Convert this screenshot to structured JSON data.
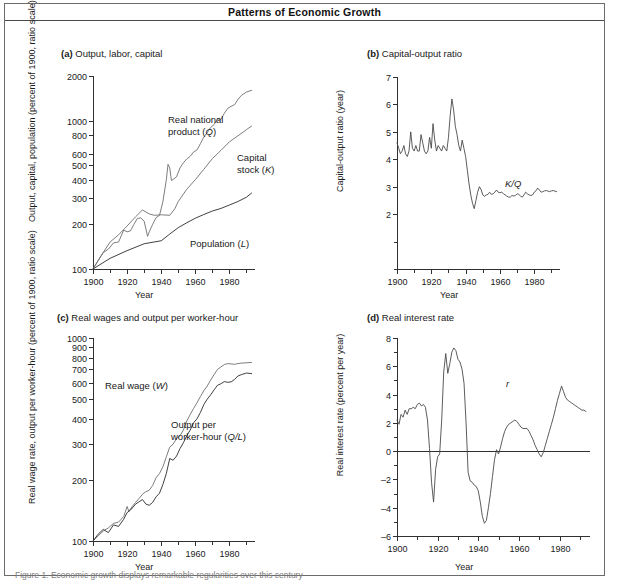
{
  "figure": {
    "title": "Patterns of Economic Growth",
    "caption": "Figure 1. Economic growth displays remarkable regularities over this century"
  },
  "common": {
    "xlabel": "Year",
    "xticks": [
      1900,
      1920,
      1940,
      1960,
      1980
    ],
    "xminor": [
      1910,
      1930,
      1950,
      1970,
      1990
    ],
    "xlim": [
      1900,
      1995
    ]
  },
  "chart_data": [
    {
      "id": "panel-a",
      "type": "line",
      "panel_letter": "(a)",
      "title": "Output, labor, capital",
      "ylabel": "Output, capital, population (percent of 1900, ratio scale)",
      "xlabel": "Year",
      "scale": "log",
      "ylim": [
        100,
        2000
      ],
      "yticks": [
        100,
        200,
        300,
        400,
        500,
        600,
        800,
        1000,
        2000
      ],
      "ytick_labels": [
        "100",
        "200",
        "300",
        "400",
        "500",
        "600",
        "800",
        "1000",
        "2000"
      ],
      "xlim": [
        1900,
        1995
      ],
      "xticks": [
        1900,
        1920,
        1940,
        1960,
        1980
      ],
      "grid": false,
      "legend_position": "inline-annotations",
      "series": [
        {
          "name": "Real national product (Q)",
          "label_html": "Real national<br>product (<i>Q</i>)",
          "color": "#6e6e6e",
          "label_x": 163,
          "label_y": 88,
          "x": [
            1900,
            1903,
            1906,
            1909,
            1912,
            1915,
            1918,
            1920,
            1922,
            1924,
            1926,
            1928,
            1930,
            1932,
            1933,
            1935,
            1937,
            1939,
            1941,
            1943,
            1944,
            1945,
            1946,
            1947,
            1949,
            1951,
            1953,
            1955,
            1957,
            1959,
            1961,
            1963,
            1965,
            1967,
            1969,
            1971,
            1973,
            1975,
            1977,
            1979,
            1981,
            1983,
            1985,
            1987,
            1990,
            1993
          ],
          "y": [
            100,
            114,
            129,
            136,
            150,
            152,
            183,
            178,
            181,
            200,
            219,
            221,
            210,
            166,
            178,
            200,
            222,
            230,
            285,
            400,
            508,
            480,
            395,
            402,
            418,
            480,
            520,
            552,
            575,
            615,
            635,
            700,
            775,
            830,
            900,
            940,
            1030,
            1020,
            1120,
            1210,
            1250,
            1280,
            1390,
            1480,
            1560,
            1600
          ]
        },
        {
          "name": "Capital stock (K)",
          "label_html": "Capital<br>stock (<i>K</i>)",
          "color": "#6e6e6e",
          "label_x": 232,
          "label_y": 126,
          "x": [
            1900,
            1905,
            1910,
            1915,
            1920,
            1925,
            1929,
            1933,
            1936,
            1940,
            1945,
            1948,
            1950,
            1955,
            1960,
            1965,
            1970,
            1975,
            1980,
            1985,
            1990,
            1993
          ],
          "y": [
            100,
            124,
            152,
            170,
            195,
            225,
            250,
            235,
            230,
            232,
            230,
            255,
            285,
            345,
            400,
            470,
            555,
            630,
            720,
            790,
            870,
            920
          ]
        },
        {
          "name": "Population (L)",
          "label_html": "Population (<i>L</i>)",
          "color": "#2a2a2a",
          "label_x": 185,
          "label_y": 212,
          "x": [
            1900,
            1910,
            1920,
            1930,
            1940,
            1945,
            1950,
            1955,
            1960,
            1965,
            1970,
            1975,
            1980,
            1985,
            1990,
            1993
          ],
          "y": [
            100,
            118,
            133,
            148,
            155,
            172,
            190,
            205,
            220,
            233,
            246,
            256,
            270,
            285,
            305,
            325
          ]
        }
      ]
    },
    {
      "id": "panel-b",
      "type": "line",
      "panel_letter": "(b)",
      "title": "Capital-output ratio",
      "ylabel": "Capital-output ratio (year)",
      "xlabel": "Year",
      "scale": "linear",
      "ylim": [
        0,
        7
      ],
      "yticks": [
        2,
        3,
        4,
        5,
        6,
        7
      ],
      "ytick_labels": [
        "2",
        "3",
        "4",
        "5",
        "6",
        "7"
      ],
      "yminor": [
        0,
        1
      ],
      "xlim": [
        1900,
        1995
      ],
      "xticks": [
        1900,
        1920,
        1940,
        1960,
        1980
      ],
      "grid": false,
      "legend_position": "right-of-line",
      "series": [
        {
          "name": "K/Q",
          "label_html": "<i>K/Q</i>",
          "color": "#4a4a4a",
          "label_x": 200,
          "label_y": 152,
          "x": [
            1900,
            1901,
            1902,
            1903,
            1904,
            1905,
            1906,
            1907,
            1908,
            1909,
            1910,
            1911,
            1912,
            1913,
            1914,
            1915,
            1916,
            1917,
            1918,
            1919,
            1920,
            1921,
            1922,
            1923,
            1924,
            1925,
            1926,
            1927,
            1928,
            1929,
            1930,
            1931,
            1932,
            1933,
            1934,
            1935,
            1936,
            1937,
            1938,
            1939,
            1940,
            1941,
            1942,
            1943,
            1944,
            1945,
            1946,
            1947,
            1948,
            1949,
            1950,
            1951,
            1952,
            1953,
            1954,
            1955,
            1956,
            1957,
            1958,
            1959,
            1960,
            1961,
            1962,
            1963,
            1964,
            1965,
            1966,
            1967,
            1968,
            1969,
            1970,
            1971,
            1972,
            1973,
            1974,
            1975,
            1976,
            1977,
            1978,
            1979,
            1980,
            1981,
            1982,
            1983,
            1984,
            1985,
            1986,
            1987,
            1988,
            1989,
            1990,
            1991,
            1992,
            1993
          ],
          "y": [
            4.6,
            4.4,
            4.2,
            4.3,
            4.5,
            4.2,
            4.1,
            4.3,
            5.0,
            4.4,
            4.3,
            4.5,
            4.3,
            4.3,
            4.9,
            4.6,
            4.3,
            4.2,
            4.3,
            4.8,
            4.4,
            5.3,
            4.7,
            4.3,
            4.5,
            4.4,
            4.3,
            4.5,
            4.4,
            4.3,
            4.8,
            5.6,
            6.2,
            5.8,
            5.2,
            4.9,
            4.5,
            4.3,
            4.7,
            4.4,
            4.1,
            3.6,
            3.1,
            2.7,
            2.4,
            2.2,
            2.5,
            2.8,
            3.0,
            2.9,
            2.7,
            2.65,
            2.7,
            2.72,
            2.8,
            2.72,
            2.74,
            2.8,
            2.88,
            2.8,
            2.78,
            2.8,
            2.75,
            2.7,
            2.66,
            2.62,
            2.62,
            2.68,
            2.66,
            2.68,
            2.74,
            2.72,
            2.66,
            2.62,
            2.7,
            2.8,
            2.74,
            2.7,
            2.68,
            2.7,
            2.8,
            2.85,
            2.95,
            2.88,
            2.8,
            2.82,
            2.85,
            2.86,
            2.84,
            2.82,
            2.85,
            2.86,
            2.84,
            2.82
          ]
        }
      ]
    },
    {
      "id": "panel-c",
      "type": "line",
      "panel_letter": "(c)",
      "title": "Real wages and output per worker-hour",
      "ylabel": "Real wage rate, output per worker-hour (percent of 1900, ratio scale)",
      "xlabel": "Year",
      "scale": "log",
      "ylim": [
        100,
        1000
      ],
      "yticks": [
        100,
        200,
        300,
        400,
        500,
        600,
        700,
        800,
        900,
        1000
      ],
      "ytick_labels": [
        "100",
        "200",
        "300",
        "400",
        "500",
        "600",
        "700",
        "800",
        "900",
        "1000"
      ],
      "xlim": [
        1900,
        1995
      ],
      "xticks": [
        1900,
        1920,
        1940,
        1960,
        1980
      ],
      "grid": false,
      "legend_position": "inline-annotations",
      "series": [
        {
          "name": "Real wage (W)",
          "label_html": "Real wage (<i>W</i>)",
          "color": "#6e6e6e",
          "label_x": 100,
          "label_y": 88,
          "x": [
            1900,
            1903,
            1906,
            1909,
            1912,
            1915,
            1918,
            1920,
            1921,
            1923,
            1925,
            1927,
            1929,
            1931,
            1933,
            1935,
            1937,
            1939,
            1941,
            1943,
            1945,
            1947,
            1949,
            1951,
            1953,
            1955,
            1957,
            1959,
            1961,
            1963,
            1965,
            1967,
            1969,
            1971,
            1973,
            1975,
            1977,
            1979,
            1981,
            1983,
            1985,
            1987,
            1990,
            1993
          ],
          "y": [
            100,
            106,
            112,
            116,
            122,
            124,
            132,
            148,
            140,
            148,
            155,
            162,
            170,
            175,
            178,
            188,
            205,
            215,
            232,
            260,
            290,
            300,
            320,
            330,
            352,
            390,
            420,
            450,
            480,
            515,
            550,
            580,
            620,
            660,
            700,
            720,
            740,
            748,
            745,
            742,
            748,
            752,
            755,
            758
          ]
        },
        {
          "name": "Output per worker-hour (Q/L)",
          "label_html": "Output per<br>worker-hour (<i>Q/L</i>)",
          "color": "#2a2a2a",
          "label_x": 166,
          "label_y": 127,
          "x": [
            1900,
            1903,
            1906,
            1909,
            1912,
            1915,
            1918,
            1920,
            1922,
            1925,
            1927,
            1929,
            1931,
            1933,
            1935,
            1937,
            1939,
            1941,
            1943,
            1945,
            1947,
            1949,
            1951,
            1953,
            1955,
            1957,
            1959,
            1961,
            1963,
            1965,
            1967,
            1969,
            1971,
            1973,
            1975,
            1977,
            1979,
            1981,
            1983,
            1985,
            1987,
            1990,
            1993
          ],
          "y": [
            100,
            108,
            114,
            110,
            120,
            118,
            128,
            138,
            142,
            152,
            156,
            160,
            152,
            150,
            155,
            165,
            172,
            190,
            215,
            255,
            250,
            262,
            285,
            305,
            330,
            352,
            382,
            400,
            430,
            470,
            500,
            525,
            555,
            585,
            595,
            610,
            605,
            608,
            625,
            650,
            660,
            672,
            668
          ]
        }
      ]
    },
    {
      "id": "panel-d",
      "type": "line",
      "panel_letter": "(d)",
      "title": "Real interest rate",
      "ylabel": "Real interest rate (percent per year)",
      "xlabel": "Year",
      "scale": "linear",
      "ylim": [
        -6,
        8
      ],
      "yticks": [
        -6,
        -4,
        -2,
        0,
        2,
        4,
        6,
        8
      ],
      "ytick_labels": [
        "–6",
        "–4",
        "–2",
        "0",
        "2",
        "4",
        "6",
        "8"
      ],
      "yminor": [
        -5,
        -3,
        -1,
        1,
        3,
        5,
        7
      ],
      "xlim": [
        1900,
        1995
      ],
      "xticks": [
        1900,
        1920,
        1940,
        1960,
        1980
      ],
      "grid": false,
      "zero_line": 0,
      "legend_position": "right-of-line",
      "series": [
        {
          "name": "r",
          "label_html": "<i>r</i>",
          "color": "#4a4a4a",
          "label_x": 201,
          "label_y": 86,
          "x": [
            1900,
            1901,
            1902,
            1903,
            1904,
            1905,
            1906,
            1907,
            1908,
            1909,
            1910,
            1911,
            1912,
            1913,
            1914,
            1915,
            1916,
            1917,
            1918,
            1919,
            1920,
            1921,
            1922,
            1923,
            1924,
            1925,
            1926,
            1927,
            1928,
            1929,
            1930,
            1931,
            1932,
            1933,
            1934,
            1935,
            1936,
            1937,
            1938,
            1939,
            1940,
            1941,
            1942,
            1943,
            1944,
            1945,
            1946,
            1947,
            1948,
            1949,
            1950,
            1951,
            1952,
            1953,
            1954,
            1955,
            1956,
            1957,
            1958,
            1959,
            1960,
            1961,
            1962,
            1963,
            1964,
            1965,
            1966,
            1967,
            1968,
            1969,
            1970,
            1971,
            1972,
            1973,
            1974,
            1975,
            1976,
            1977,
            1978,
            1979,
            1980,
            1981,
            1982,
            1983,
            1984,
            1985,
            1986,
            1987,
            1988,
            1989,
            1990,
            1991,
            1992,
            1993
          ],
          "y": [
            2.2,
            1.9,
            2.6,
            2.4,
            2.9,
            2.6,
            3.0,
            3.0,
            3.1,
            3.0,
            3.3,
            3.4,
            3.2,
            3.3,
            3.1,
            2.2,
            0.2,
            -2.2,
            -3.6,
            -1.3,
            -0.4,
            -0.2,
            2.2,
            5.6,
            6.9,
            5.5,
            6.2,
            7.0,
            7.3,
            7.1,
            6.5,
            6.3,
            5.8,
            4.8,
            2.0,
            -1.5,
            -2.1,
            -2.2,
            -2.4,
            -2.5,
            -2.8,
            -3.6,
            -4.6,
            -5.1,
            -4.9,
            -4.0,
            -3.0,
            -1.8,
            -0.6,
            0.1,
            -0.2,
            0.3,
            0.9,
            1.4,
            1.7,
            1.9,
            2.0,
            2.1,
            2.2,
            2.1,
            1.9,
            1.7,
            1.6,
            1.6,
            1.6,
            1.4,
            1.1,
            0.8,
            0.4,
            0.1,
            -0.2,
            -0.4,
            -0.1,
            0.4,
            0.9,
            1.4,
            1.9,
            2.4,
            3.0,
            3.6,
            4.1,
            4.6,
            4.2,
            3.8,
            3.6,
            3.5,
            3.4,
            3.3,
            3.2,
            3.1,
            3.0,
            2.9,
            2.9,
            2.8,
            2.8
          ]
        }
      ]
    }
  ]
}
